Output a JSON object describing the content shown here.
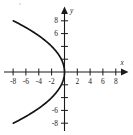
{
  "chart_data": {
    "type": "line",
    "title": "",
    "subtitle": "",
    "xlabel": "x",
    "ylabel": "y",
    "xlim": [
      -9.8,
      9.8
    ],
    "ylim": [
      -9.8,
      9.8
    ],
    "grid": false,
    "legend": null,
    "annotations": [],
    "curve_label": "leftward-opening parabola",
    "equation": "x = -y^2/8",
    "vertex": [
      0,
      0
    ],
    "opens": "left",
    "x_ticks": [
      -8,
      -6,
      -4,
      -2,
      2,
      4,
      6,
      8
    ],
    "x_tick_labels": [
      "-8",
      "-6",
      "-4",
      "-2",
      "2",
      "4",
      "6",
      "8"
    ],
    "y_ticks": [
      -8,
      -6,
      -4,
      -2,
      2,
      4,
      6,
      8
    ],
    "y_tick_labels": [
      "-8",
      "-6",
      "",
      "",
      "",
      "",
      "6",
      "8"
    ],
    "y_labeled_ticks": [
      8,
      6,
      -6,
      -8
    ],
    "y_labeled_text": [
      "8",
      "6",
      "-6",
      "-8"
    ],
    "series": [
      {
        "name": "x = -y^2/8",
        "x": [
          -8.0,
          -6.13,
          -4.5,
          -3.13,
          -2.0,
          -1.13,
          -0.5,
          -0.13,
          0.0,
          -0.13,
          -0.5,
          -1.13,
          -2.0,
          -3.13,
          -4.5,
          -6.13,
          -8.0
        ],
        "y": [
          8.0,
          7.0,
          6.0,
          5.0,
          4.0,
          3.0,
          2.0,
          1.0,
          0.0,
          -1.0,
          -2.0,
          -3.0,
          -4.0,
          -5.0,
          -6.0,
          -7.0,
          -8.0
        ]
      }
    ],
    "colors": {
      "curve": "#141414",
      "axis": "#1a1a1a",
      "background": "#ffffff",
      "text": "#1a1a1a"
    }
  },
  "figure": {
    "axis_x_label": "x",
    "axis_y_label": "y",
    "origin_label": ""
  }
}
